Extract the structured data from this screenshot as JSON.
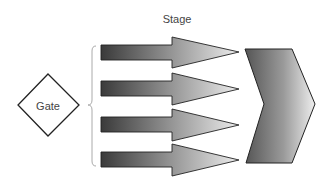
{
  "diagram": {
    "title": "Stage",
    "gate": {
      "label": "Gate",
      "shape": "diamond"
    },
    "arrows": [
      {
        "name": "activity-arrow-1"
      },
      {
        "name": "activity-arrow-2"
      },
      {
        "name": "activity-arrow-3"
      },
      {
        "name": "activity-arrow-4"
      }
    ],
    "target": {
      "shape": "chevron"
    },
    "connector": {
      "shape": "curly-brace"
    },
    "colors": {
      "arrow_dark": "#3a3a3a",
      "arrow_light": "#e8e8e8",
      "outline": "#222222",
      "brace": "#aaaaaa",
      "text": "#444444"
    }
  }
}
